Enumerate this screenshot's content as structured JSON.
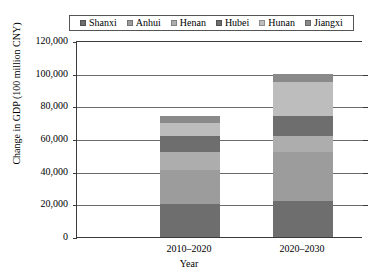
{
  "chart_data": {
    "type": "bar",
    "subtype": "stacked",
    "title": "",
    "xlabel": "Year",
    "ylabel": "Change in GDP (100 million CNY)",
    "categories": [
      "2010–2020",
      "2020–2030"
    ],
    "ylim": [
      0,
      120000
    ],
    "yticks": [
      0,
      20000,
      40000,
      60000,
      80000,
      100000,
      120000
    ],
    "ytick_labels": [
      "0",
      "20,000",
      "40,000",
      "60,000",
      "80,000",
      "100,000",
      "120,000"
    ],
    "grid": true,
    "legend_position": "top",
    "series": [
      {
        "name": "Shanxi",
        "color": "#6e6e6e",
        "values": [
          20000,
          22000
        ]
      },
      {
        "name": "Anhui",
        "color": "#9c9c9c",
        "values": [
          21000,
          30000
        ]
      },
      {
        "name": "Henan",
        "color": "#adadad",
        "values": [
          11000,
          10000
        ]
      },
      {
        "name": "Hubei",
        "color": "#6e6e6e",
        "values": [
          10000,
          12000
        ]
      },
      {
        "name": "Hunan",
        "color": "#bdbdbd",
        "values": [
          8000,
          21000
        ]
      },
      {
        "name": "Jiangxi",
        "color": "#8a8a8a",
        "values": [
          4000,
          5000
        ]
      }
    ],
    "totals": [
      74000,
      100000
    ]
  },
  "legend": {
    "items": [
      {
        "label": "Shanxi"
      },
      {
        "label": "Anhui"
      },
      {
        "label": "Henan"
      },
      {
        "label": "Hubei"
      },
      {
        "label": "Hunan"
      },
      {
        "label": "Jiangxi"
      }
    ]
  },
  "axes": {
    "y_title": "Change in GDP (100 million CNY)",
    "x_title": "Year",
    "y_ticks": [
      "120,000",
      "100,000",
      "80,000",
      "60,000",
      "40,000",
      "20,000",
      "0"
    ],
    "x_ticks": [
      "2010–2020",
      "2020–2030"
    ]
  }
}
